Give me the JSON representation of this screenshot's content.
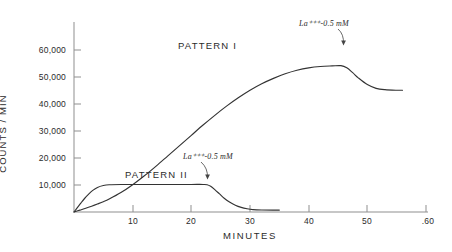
{
  "chart_data": {
    "type": "line",
    "title": "",
    "xlabel": "MINUTES",
    "ylabel": "COUNTS / MIN",
    "xlim": [
      0,
      62
    ],
    "ylim": [
      0,
      62000
    ],
    "grid": false,
    "legend_position": "inline-annotations",
    "xticks": [
      10,
      20,
      30,
      40,
      50,
      60
    ],
    "xtick_labels": [
      "10",
      "20",
      "30",
      "40",
      "50",
      ".60"
    ],
    "yticks": [
      10000,
      20000,
      30000,
      40000,
      50000,
      60000
    ],
    "ytick_labels": [
      "10,000",
      "20,000",
      "30,000",
      "40,000",
      "50,000",
      "60,000"
    ],
    "series": [
      {
        "name": "PATTERN I",
        "label_position": {
          "x": 18,
          "y": 52500
        },
        "points": [
          [
            0,
            0
          ],
          [
            1,
            700
          ],
          [
            2,
            1400
          ],
          [
            3,
            2150
          ],
          [
            4,
            2950
          ],
          [
            5,
            3800
          ],
          [
            6,
            4800
          ],
          [
            8,
            7200
          ],
          [
            10,
            10100
          ],
          [
            12,
            13400
          ],
          [
            14,
            17000
          ],
          [
            16,
            20800
          ],
          [
            18,
            24600
          ],
          [
            20,
            28400
          ],
          [
            22,
            32200
          ],
          [
            24,
            35800
          ],
          [
            26,
            39200
          ],
          [
            28,
            42300
          ],
          [
            30,
            45100
          ],
          [
            32,
            47500
          ],
          [
            34,
            49500
          ],
          [
            36,
            51200
          ],
          [
            38,
            52500
          ],
          [
            40,
            53400
          ],
          [
            42,
            53900
          ],
          [
            44,
            54100
          ],
          [
            45.5,
            54200
          ],
          [
            46.5,
            53400
          ],
          [
            47.5,
            51600
          ],
          [
            48.5,
            49600
          ],
          [
            50,
            47200
          ],
          [
            51.5,
            45800
          ],
          [
            53,
            45300
          ],
          [
            55,
            45100
          ],
          [
            56,
            45100
          ]
        ]
      },
      {
        "name": "PATTERN II",
        "label_position": {
          "x": 11,
          "y": 11900
        },
        "points": [
          [
            0,
            0
          ],
          [
            0.6,
            1700
          ],
          [
            1.2,
            3400
          ],
          [
            1.8,
            5000
          ],
          [
            2.5,
            6600
          ],
          [
            3.2,
            8000
          ],
          [
            4,
            9100
          ],
          [
            5,
            9800
          ],
          [
            6,
            10100
          ],
          [
            8,
            10200
          ],
          [
            12,
            10200
          ],
          [
            16,
            10200
          ],
          [
            20,
            10200
          ],
          [
            22,
            10200
          ],
          [
            22.7,
            10100
          ],
          [
            23.3,
            9500
          ],
          [
            24,
            8300
          ],
          [
            24.8,
            6700
          ],
          [
            25.6,
            5100
          ],
          [
            26.5,
            3700
          ],
          [
            27.5,
            2500
          ],
          [
            28.5,
            1700
          ],
          [
            29.5,
            1200
          ],
          [
            30.5,
            900
          ],
          [
            32,
            750
          ],
          [
            34,
            700
          ],
          [
            35,
            700
          ]
        ]
      }
    ],
    "annotations": [
      {
        "id": "annotation-pattern-1",
        "text": "La⁺⁺⁺-0.5 mM",
        "target": {
          "x": 45.5,
          "y": 54200
        },
        "text_position": {
          "x": 38.5,
          "y": 60900
        }
      },
      {
        "id": "annotation-pattern-2",
        "text": "La⁺⁺⁺-0.5 mM",
        "target": {
          "x": 22.6,
          "y": 10200
        },
        "text_position": {
          "x": 18.7,
          "y": 17200
        }
      }
    ],
    "line_color": "#333333",
    "axis_color": "#8a8a8a"
  }
}
